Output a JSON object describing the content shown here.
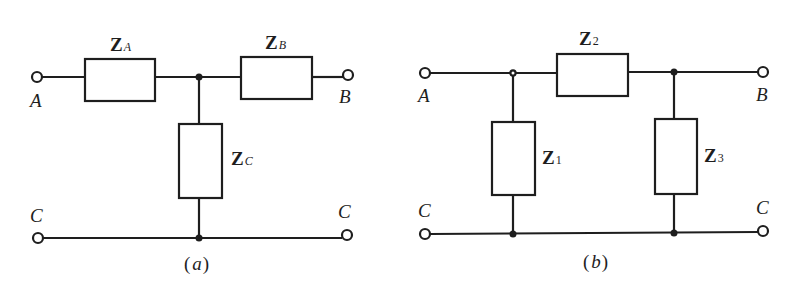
{
  "figures": [
    {
      "id": "a",
      "caption": "(a)",
      "caption_paren_open": "(",
      "caption_letter": "a",
      "caption_paren_close": ")",
      "topology": "T-network",
      "impedances": [
        {
          "main": "Z",
          "sub": "A",
          "position": "series-left"
        },
        {
          "main": "Z",
          "sub": "B",
          "position": "series-right"
        },
        {
          "main": "Z",
          "sub": "C",
          "position": "shunt"
        }
      ],
      "terminals": {
        "top_left": "A",
        "top_right": "B",
        "bottom_left": "C",
        "bottom_right": "C"
      }
    },
    {
      "id": "b",
      "caption": "(b)",
      "caption_paren_open": "(",
      "caption_letter": "b",
      "caption_paren_close": ")",
      "topology": "Pi-network",
      "impedances": [
        {
          "main": "Z",
          "sub": "1",
          "position": "shunt-left"
        },
        {
          "main": "Z",
          "sub": "2",
          "position": "series"
        },
        {
          "main": "Z",
          "sub": "3",
          "position": "shunt-right"
        }
      ],
      "terminals": {
        "top_left": "A",
        "top_right": "B",
        "bottom_left": "C",
        "bottom_right": "C"
      }
    }
  ],
  "colors": {
    "ink": "#1e1e1e",
    "background": "#ffffff"
  }
}
